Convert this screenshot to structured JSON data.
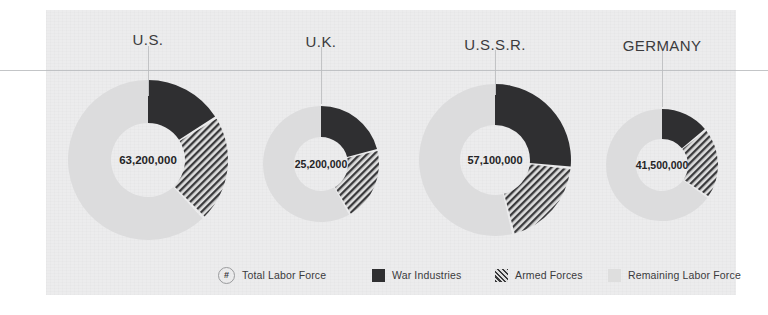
{
  "figure": {
    "background_color": "#ffffff",
    "panel_color": "#ececed",
    "rule_color": "#b9bbbd"
  },
  "colors": {
    "war_industries": "#2f2f31",
    "armed_forces_hatch": "#3a3a3c",
    "armed_forces_base": "#dedede",
    "remaining_labor_force": "#dcdcdd",
    "donut_hole": "#ececed",
    "text": "#3b3b3d"
  },
  "chart_data": {
    "type": "pie",
    "title": "",
    "subtitle": "",
    "xlabel": "",
    "ylabel": "",
    "legend_position": "bottom",
    "grid": false,
    "note": "Four donut charts, one per country; each shows share of the total labor force split into War Industries, Armed Forces, and Remaining Labor Force. Slices start at 12 o'clock and run clockwise.",
    "series": [
      {
        "name": "War Industries",
        "values": [
          16,
          21,
          26,
          14
        ]
      },
      {
        "name": "Armed Forces",
        "values": [
          21,
          20,
          19,
          20
        ]
      },
      {
        "name": "Remaining Labor Force",
        "values": [
          63,
          59,
          55,
          66
        ]
      }
    ],
    "categories": [
      "U.S.",
      "U.K.",
      "U.S.S.R.",
      "GERMANY"
    ],
    "charts": [
      {
        "country": "U.S.",
        "total_label": "63,200,000",
        "total_value": 63200000,
        "outer_radius_px": 80,
        "inner_radius_px": 37,
        "slices": [
          {
            "label": "War Industries",
            "percent": 16,
            "start_deg": 0,
            "end_deg": 57
          },
          {
            "label": "Armed Forces",
            "percent": 21,
            "start_deg": 59,
            "end_deg": 135
          },
          {
            "label": "Remaining Labor Force",
            "percent": 63,
            "start_deg": 137,
            "end_deg": 360
          }
        ]
      },
      {
        "country": "U.K.",
        "total_label": "25,200,000",
        "total_value": 25200000,
        "outer_radius_px": 58,
        "inner_radius_px": 27,
        "slices": [
          {
            "label": "War Industries",
            "percent": 21,
            "start_deg": 0,
            "end_deg": 75
          },
          {
            "label": "Armed Forces",
            "percent": 20,
            "start_deg": 77,
            "end_deg": 149
          },
          {
            "label": "Remaining Labor Force",
            "percent": 59,
            "start_deg": 151,
            "end_deg": 360
          }
        ]
      },
      {
        "country": "U.S.S.R.",
        "total_label": "57,100,000",
        "total_value": 57100000,
        "outer_radius_px": 76,
        "inner_radius_px": 35,
        "slices": [
          {
            "label": "War Industries",
            "percent": 26,
            "start_deg": 0,
            "end_deg": 95
          },
          {
            "label": "Armed Forces",
            "percent": 19,
            "start_deg": 97,
            "end_deg": 165
          },
          {
            "label": "Remaining Labor Force",
            "percent": 55,
            "start_deg": 167,
            "end_deg": 360
          }
        ]
      },
      {
        "country": "GERMANY",
        "total_label": "41,500,000",
        "total_value": 41500000,
        "outer_radius_px": 56,
        "inner_radius_px": 26,
        "slices": [
          {
            "label": "War Industries",
            "percent": 14,
            "start_deg": 0,
            "end_deg": 50
          },
          {
            "label": "Armed Forces",
            "percent": 20,
            "start_deg": 52,
            "end_deg": 124
          },
          {
            "label": "Remaining Labor Force",
            "percent": 66,
            "start_deg": 126,
            "end_deg": 360
          }
        ]
      }
    ]
  },
  "captions": [
    {
      "label": "U.S.",
      "center_x": 148,
      "y": 31
    },
    {
      "label": "U.K.",
      "center_x": 321,
      "y": 33
    },
    {
      "label": "U.S.S.R.",
      "center_x": 495,
      "y": 36
    },
    {
      "label": "GERMANY",
      "center_x": 662,
      "y": 37
    }
  ],
  "legend": {
    "items": [
      {
        "id": "total-labor-force",
        "marker": "hash-badge",
        "glyph": "#",
        "label": "Total Labor Force",
        "x": 218
      },
      {
        "id": "war-industries",
        "marker": "solid",
        "label": "War Industries",
        "x": 372
      },
      {
        "id": "armed-forces",
        "marker": "hatch",
        "label": "Armed Forces",
        "x": 495
      },
      {
        "id": "remaining-labor-force",
        "marker": "light",
        "label": "Remaining Labor Force",
        "x": 608
      }
    ]
  }
}
